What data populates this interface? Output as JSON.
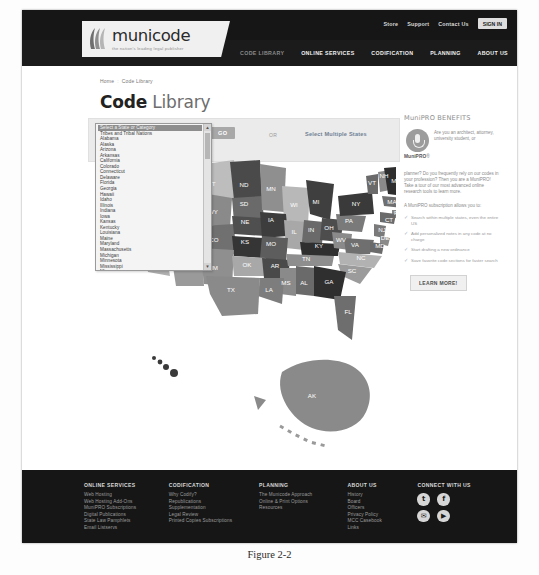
{
  "caption": "Figure 2-2",
  "topbar": {
    "links": [
      "Store",
      "Support",
      "Contact Us"
    ],
    "signin_label": "SIGN IN"
  },
  "logo": {
    "word": "municode",
    "tagline": "the nation's leading legal publisher"
  },
  "mainnav": [
    {
      "label": "CODE LIBRARY",
      "active": true
    },
    {
      "label": "ONLINE SERVICES",
      "active": false
    },
    {
      "label": "CODIFICATION",
      "active": false
    },
    {
      "label": "PLANNING",
      "active": false
    },
    {
      "label": "ABOUT US",
      "active": false
    }
  ],
  "breadcrumb": {
    "home": "Home",
    "current": "Code Library"
  },
  "page_title": {
    "bold": "Code",
    "light": "Library"
  },
  "selector": {
    "go_label": "GO",
    "or_label": "OR",
    "multi_label": "Select Multiple States",
    "selected_option": "Select a State or Category",
    "options": [
      "Select a State or Category",
      "Tribes and Tribal Nations",
      "Alabama",
      "Alaska",
      "Arizona",
      "Arkansas",
      "California",
      "Colorado",
      "Connecticut",
      "Delaware",
      "Florida",
      "Georgia",
      "Hawaii",
      "Idaho",
      "Illinois",
      "Indiana",
      "Iowa",
      "Kansas",
      "Kentucky",
      "Louisiana",
      "Maine",
      "Maryland",
      "Massachusetts",
      "Michigan",
      "Minnesota",
      "Mississippi",
      "Missouri",
      "Montana",
      "Nebraska",
      "Nevada"
    ]
  },
  "map": {
    "labels": [
      {
        "abbr": "WA",
        "x": 28,
        "y": 38,
        "fill": "#9a9a9a"
      },
      {
        "abbr": "OR",
        "x": 24,
        "y": 67,
        "fill": "#8a8a8a"
      },
      {
        "abbr": "ID",
        "x": 52,
        "y": 62,
        "fill": "#6f6f6f"
      },
      {
        "abbr": "MT",
        "x": 77,
        "y": 42,
        "fill": "#bdbdbd"
      },
      {
        "abbr": "ND",
        "x": 110,
        "y": 43,
        "fill": "#4a4a4a"
      },
      {
        "abbr": "SD",
        "x": 110,
        "y": 62,
        "fill": "#6a6a6a"
      },
      {
        "abbr": "MN",
        "x": 137,
        "y": 47,
        "fill": "#8f8f8f"
      },
      {
        "abbr": "WI",
        "x": 160,
        "y": 63,
        "fill": "#b8b8b8"
      },
      {
        "abbr": "MI",
        "x": 182,
        "y": 60,
        "fill": "#3f3f3f"
      },
      {
        "abbr": "NV",
        "x": 28,
        "y": 95,
        "fill": "#7e7e7e"
      },
      {
        "abbr": "UT",
        "x": 54,
        "y": 95,
        "fill": "#9e9e9e"
      },
      {
        "abbr": "WY",
        "x": 79,
        "y": 70,
        "fill": "#8a8a8a"
      },
      {
        "abbr": "CO",
        "x": 80,
        "y": 98,
        "fill": "#707070"
      },
      {
        "abbr": "NE",
        "x": 111,
        "y": 80,
        "fill": "#4f4f4f"
      },
      {
        "abbr": "IA",
        "x": 137,
        "y": 78,
        "fill": "#3d3d3d"
      },
      {
        "abbr": "IL",
        "x": 160,
        "y": 90,
        "fill": "#a8a8a8"
      },
      {
        "abbr": "IN",
        "x": 177,
        "y": 88,
        "fill": "#6a6a6a"
      },
      {
        "abbr": "OH",
        "x": 195,
        "y": 86,
        "fill": "#4d4d4d"
      },
      {
        "abbr": "KS",
        "x": 111,
        "y": 100,
        "fill": "#353535"
      },
      {
        "abbr": "MO",
        "x": 137,
        "y": 102,
        "fill": "#5d5d5d"
      },
      {
        "abbr": "KY",
        "x": 185,
        "y": 104,
        "fill": "#2f2f2f"
      },
      {
        "abbr": "WV",
        "x": 207,
        "y": 98,
        "fill": "#8a8a8a"
      },
      {
        "abbr": "VA",
        "x": 221,
        "y": 103,
        "fill": "#6f6f6f"
      },
      {
        "abbr": "CA",
        "x": 14,
        "y": 108,
        "fill": "#b0b0b0"
      },
      {
        "abbr": "AZ",
        "x": 50,
        "y": 124,
        "fill": "#9a9a9a"
      },
      {
        "abbr": "NM",
        "x": 79,
        "y": 126,
        "fill": "#8f8f8f"
      },
      {
        "abbr": "OK",
        "x": 113,
        "y": 123,
        "fill": "#a8a8a8"
      },
      {
        "abbr": "AR",
        "x": 141,
        "y": 124,
        "fill": "#4a4a4a"
      },
      {
        "abbr": "TN",
        "x": 172,
        "y": 117,
        "fill": "#8e8e8e"
      },
      {
        "abbr": "NC",
        "x": 227,
        "y": 116,
        "fill": "#b2b2b2"
      },
      {
        "abbr": "SC",
        "x": 218,
        "y": 129,
        "fill": "#9b9b9b"
      },
      {
        "abbr": "MS",
        "x": 152,
        "y": 141,
        "fill": "#8a8a8a"
      },
      {
        "abbr": "AL",
        "x": 170,
        "y": 141,
        "fill": "#6a6a6a"
      },
      {
        "abbr": "GA",
        "x": 195,
        "y": 140,
        "fill": "#2f2f2f"
      },
      {
        "abbr": "LA",
        "x": 135,
        "y": 148,
        "fill": "#7d7d7d"
      },
      {
        "abbr": "TX",
        "x": 97,
        "y": 148,
        "fill": "#8a8a8a"
      },
      {
        "abbr": "FL",
        "x": 214,
        "y": 170,
        "fill": "#6e6e6e"
      },
      {
        "abbr": "PA",
        "x": 215,
        "y": 79,
        "fill": "#7a7a7a"
      },
      {
        "abbr": "NY",
        "x": 222,
        "y": 62,
        "fill": "#3a3a3a"
      },
      {
        "abbr": "VT",
        "x": 238,
        "y": 41,
        "fill": "#6a6a6a"
      },
      {
        "abbr": "NH",
        "x": 250,
        "y": 34,
        "fill": "#8a8a8a"
      },
      {
        "abbr": "ME",
        "x": 262,
        "y": 39,
        "fill": "#2e2e2e"
      },
      {
        "abbr": "MA",
        "x": 258,
        "y": 60,
        "fill": "#6f6f6f"
      },
      {
        "abbr": "RI",
        "x": 263,
        "y": 71,
        "fill": "#8a8a8a"
      },
      {
        "abbr": "CT",
        "x": 255,
        "y": 78,
        "fill": "#6a6a6a"
      },
      {
        "abbr": "NJ",
        "x": 248,
        "y": 88,
        "fill": "#7a7a7a"
      },
      {
        "abbr": "DE",
        "x": 251,
        "y": 96,
        "fill": "#8a8a8a"
      },
      {
        "abbr": "MD",
        "x": 246,
        "y": 104,
        "fill": "#6a6a6a"
      },
      {
        "abbr": "AK",
        "x": 178,
        "y": 254,
        "fill": "#8a8a8a"
      },
      {
        "abbr": "HI",
        "x": 38,
        "y": 225,
        "fill": "#3a3a3a"
      }
    ]
  },
  "rail": {
    "title": "MuniPRO BENEFITS",
    "brand": "MuniPRO",
    "brand_suffix": "®",
    "intro": "Are you an architect, attorney, university student, or",
    "intro2": "planner? Do you frequently rely on our codes in your profession? Then you are a MuniPRO! Take a tour of our most advanced online research tools to learn more.",
    "sub_heading": "A MuniPRO subscription allows you to:",
    "bullets": [
      "Search within multiple states, even the entire US",
      "Add personalized notes in any code at no charge",
      "Start drafting a new ordinance",
      "Save favorite code sections for faster search"
    ],
    "learn_more_label": "LEARN MORE!"
  },
  "footer": {
    "columns": [
      {
        "heading": "ONLINE SERVICES",
        "links": [
          "Web Hosting",
          "Web Hosting Add-Ons",
          "MuniPRO Subscriptions",
          "Digital Publications",
          "State Law Pamphlets",
          "Email Listservs"
        ]
      },
      {
        "heading": "CODIFICATION",
        "links": [
          "Why Codify?",
          "Republications",
          "Supplementation",
          "Legal Review",
          "Printed Copies Subscriptions"
        ]
      },
      {
        "heading": "PLANNING",
        "links": [
          "The Municode Approach",
          "Online & Print Options",
          "Resources"
        ]
      },
      {
        "heading": "ABOUT US",
        "links": [
          "History",
          "Board",
          "Officers",
          "Privacy Policy",
          "MCC Casebook",
          "Links"
        ]
      }
    ],
    "connect_heading": "CONNECT WITH US",
    "social": [
      {
        "name": "twitter-icon",
        "glyph": "t"
      },
      {
        "name": "facebook-icon",
        "glyph": "f"
      },
      {
        "name": "email-icon",
        "glyph": "✉"
      },
      {
        "name": "youtube-icon",
        "glyph": "▶"
      }
    ]
  }
}
